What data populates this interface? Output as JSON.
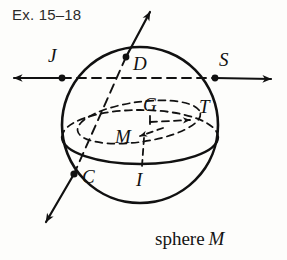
{
  "figure": {
    "exercise_label": "Ex. 15–18",
    "caption_text": "sphere",
    "caption_object": "M",
    "ink_color": "#111111",
    "paper_color": "#fdfdfb",
    "label_color": "#2b2b2b"
  },
  "points": [
    {
      "id": "J",
      "label": "J",
      "x": 62,
      "y": 78,
      "label_x": 48,
      "label_y": 62,
      "has_dot": true
    },
    {
      "id": "D",
      "label": "D",
      "x": 126,
      "y": 57,
      "label_x": 133,
      "label_y": 70,
      "has_dot": true
    },
    {
      "id": "S",
      "label": "S",
      "x": 215,
      "y": 78,
      "label_x": 219,
      "label_y": 66,
      "has_dot": true
    },
    {
      "id": "G",
      "label": "G",
      "x": 150,
      "y": 117,
      "label_x": 143,
      "label_y": 111,
      "has_dot": false
    },
    {
      "id": "T",
      "label": "T",
      "x": 194,
      "y": 119,
      "label_x": 199,
      "label_y": 113,
      "has_dot": false
    },
    {
      "id": "M",
      "label": "M",
      "x": 146,
      "y": 135,
      "label_x": 115,
      "label_y": 143,
      "has_dot": false
    },
    {
      "id": "C",
      "label": "C",
      "x": 74,
      "y": 174,
      "label_x": 82,
      "label_y": 183,
      "has_dot": true
    },
    {
      "id": "I",
      "label": "I",
      "x": 142,
      "y": 166,
      "label_x": 136,
      "label_y": 186,
      "has_dot": false
    }
  ],
  "shapes": {
    "sphere": {
      "name": "sphere-outline",
      "cx": 140,
      "cy": 125,
      "r": 78
    },
    "equator": {
      "name": "equator-ellipse",
      "cx": 140,
      "cy": 137,
      "rx": 78,
      "ry": 27
    },
    "small_circle": {
      "name": "tilted-small-circle",
      "cx": 139,
      "cy": 122,
      "rx": 62,
      "ry": 20,
      "rotation": -8
    }
  },
  "lines": [
    {
      "name": "line-JS",
      "style": "dashed-interior-with-solid-rays",
      "from": "J",
      "to": "S",
      "arrows": "both"
    },
    {
      "name": "line-CD",
      "style": "dashed-interior-with-solid-rays",
      "from": "C",
      "to": "D",
      "arrows": "both"
    },
    {
      "name": "segment-GT",
      "style": "dashed",
      "from": "G",
      "to": "T",
      "arrows": "to-T"
    },
    {
      "name": "segment-MI",
      "style": "dashed",
      "from": "M",
      "to": "I",
      "arrows": "none"
    },
    {
      "name": "pointer-to-M",
      "style": "dashed",
      "from": "label-M",
      "to": "M",
      "arrows": "to-M"
    }
  ]
}
